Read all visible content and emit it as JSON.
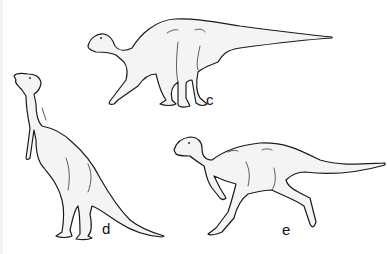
{
  "figure": {
    "panels": [
      {
        "label": "c",
        "pose": "quadrupedal walking"
      },
      {
        "label": "d",
        "pose": "bipedal upright standing"
      },
      {
        "label": "e",
        "pose": "bipedal running"
      }
    ]
  },
  "colors": {
    "background": "#ffffff",
    "line": "#1a1a1a",
    "fill": "#f4f4f4"
  }
}
